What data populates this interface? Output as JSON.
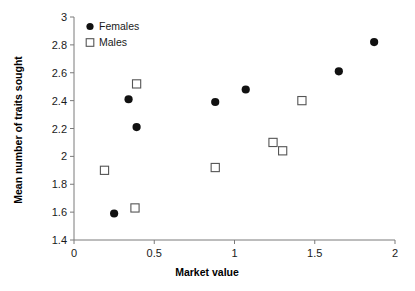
{
  "chart_data": {
    "type": "scatter",
    "title": "",
    "xlabel": "Market value",
    "ylabel": "Mean number of traits sought",
    "xlim": [
      0,
      2
    ],
    "ylim": [
      1.4,
      3
    ],
    "xticks": [
      "0",
      "0.5",
      "1",
      "1.5",
      "2"
    ],
    "xtick_values": [
      0,
      0.5,
      1,
      1.5,
      2
    ],
    "yticks": [
      "1.4",
      "1.6",
      "1.8",
      "2",
      "2.2",
      "2.4",
      "2.6",
      "2.8",
      "3"
    ],
    "ytick_values": [
      1.4,
      1.6,
      1.8,
      2.0,
      2.2,
      2.4,
      2.6,
      2.8,
      3.0
    ],
    "grid": false,
    "legend_position": "top-left",
    "series": [
      {
        "name": "Females",
        "marker": "filled-circle",
        "color": "#111111",
        "points": [
          {
            "x": 0.25,
            "y": 1.59
          },
          {
            "x": 0.34,
            "y": 2.41
          },
          {
            "x": 0.39,
            "y": 2.21
          },
          {
            "x": 0.88,
            "y": 2.39
          },
          {
            "x": 1.07,
            "y": 2.48
          },
          {
            "x": 1.65,
            "y": 2.61
          },
          {
            "x": 1.87,
            "y": 2.82
          }
        ]
      },
      {
        "name": "Males",
        "marker": "open-square",
        "color": "#555555",
        "points": [
          {
            "x": 0.19,
            "y": 1.9
          },
          {
            "x": 0.38,
            "y": 1.63
          },
          {
            "x": 0.39,
            "y": 2.52
          },
          {
            "x": 0.88,
            "y": 1.92
          },
          {
            "x": 1.24,
            "y": 2.1
          },
          {
            "x": 1.3,
            "y": 2.04
          },
          {
            "x": 1.42,
            "y": 2.4
          }
        ]
      }
    ]
  },
  "legend": {
    "entries": [
      {
        "label": "Females"
      },
      {
        "label": "Males"
      }
    ]
  },
  "axes": {
    "x_title": "Market value",
    "y_title": "Mean number of traits sought"
  }
}
